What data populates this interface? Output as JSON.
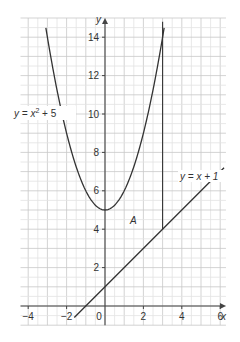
{
  "chart_data": {
    "type": "line",
    "title": "",
    "xlabel": "x",
    "ylabel": "y",
    "xlim": [
      -4.4,
      6.3
    ],
    "ylim": [
      -1,
      15
    ],
    "grid": true,
    "x_ticks": [
      -4,
      -2,
      0,
      2,
      4,
      6
    ],
    "y_ticks": [
      2,
      4,
      6,
      8,
      10,
      12,
      14
    ],
    "x_tick_labels": [
      "−4",
      "−2",
      "0",
      "2",
      "4",
      "6"
    ],
    "y_tick_labels": [
      "2",
      "4",
      "6",
      "8",
      "10",
      "12",
      "14"
    ],
    "series": [
      {
        "name": "y = x² + 5",
        "label_parts": {
          "pre": "y = x",
          "sup": "2",
          "post": " + 5"
        },
        "equation": "x^2+5",
        "x_range": [
          -3.08,
          3.08
        ],
        "points": [
          [
            -3,
            14
          ],
          [
            -2,
            9
          ],
          [
            -1,
            6
          ],
          [
            0,
            5
          ],
          [
            1,
            6
          ],
          [
            2,
            9
          ],
          [
            3,
            14
          ]
        ]
      },
      {
        "name": "y = x + 1",
        "equation": "x+1",
        "x_range": [
          -1.6,
          6.2
        ],
        "points": [
          [
            -1.6,
            -0.6
          ],
          [
            0,
            1
          ],
          [
            3,
            4
          ],
          [
            6.2,
            7.2
          ]
        ]
      },
      {
        "name": "x = 3",
        "equation": "vertical line",
        "points": [
          [
            3,
            4
          ],
          [
            3,
            14.8
          ]
        ]
      }
    ],
    "annotations": [
      {
        "text": "A",
        "x": 1.5,
        "y": 4.4,
        "description": "region bounded by the parabola, the line y = x + 1, x = 0 and x = 3"
      }
    ]
  },
  "labels": {
    "x_axis": "x",
    "y_axis": "y",
    "origin": "0",
    "region": "A",
    "line_label": "y = x + 1",
    "curve_pre": "y = x",
    "curve_sup": "2",
    "curve_post": " + 5"
  }
}
